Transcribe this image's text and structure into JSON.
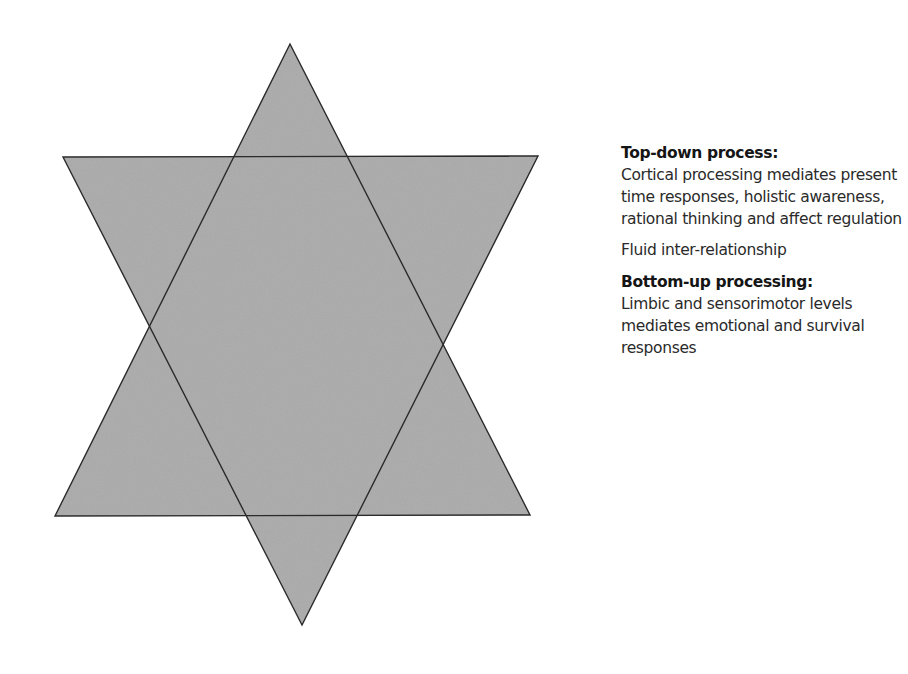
{
  "diagram": {
    "shape": "hexagram",
    "fill_color": "#a8a8a8",
    "stroke_color": "#2b2b2b",
    "triangles": [
      {
        "name": "upward-triangle",
        "meaning": "bottom-up processing",
        "points": [
          [
            290,
            44
          ],
          [
            55,
            516
          ],
          [
            530,
            515
          ]
        ]
      },
      {
        "name": "downward-triangle",
        "meaning": "top-down process",
        "points": [
          [
            63,
            157
          ],
          [
            538,
            156
          ],
          [
            302,
            625
          ]
        ]
      }
    ]
  },
  "legend": {
    "top_down": {
      "heading": "Top-down process:",
      "description": "Cortical processing mediates present time responses, holistic awareness, rational thinking and affect regulation"
    },
    "relationship": {
      "text": "Fluid inter-relationship"
    },
    "bottom_up": {
      "heading": "Bottom-up processing:",
      "description": "Limbic and sensorimotor levels mediates emotional and survival responses"
    }
  }
}
